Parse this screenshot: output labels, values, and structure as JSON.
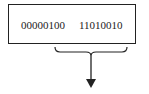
{
  "diagram": {
    "bytes": [
      "00000100",
      "11010010"
    ],
    "stroke_color": "#222222"
  }
}
